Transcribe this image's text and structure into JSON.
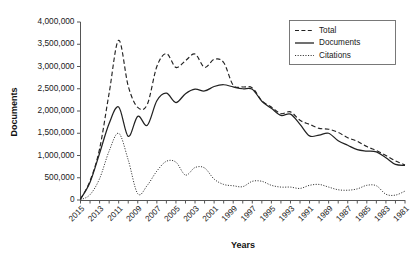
{
  "chart_data": {
    "type": "line",
    "title": "",
    "xlabel": "Years",
    "ylabel": "Documents",
    "grid": false,
    "legend_position": "top-right",
    "x_reversed": true,
    "ylim": [
      0,
      4000000
    ],
    "ytick_labels": [
      "4,000,000",
      "3,500,000",
      "3,000,000",
      "2,500,000",
      "2,000,000",
      "1,500,000",
      "1,000,000",
      "500,000",
      "0"
    ],
    "ytick_values": [
      4000000,
      3500000,
      3000000,
      2500000,
      2000000,
      1500000,
      1000000,
      500000,
      0
    ],
    "x": [
      2015,
      2014,
      2013,
      2012,
      2011,
      2010,
      2009,
      2008,
      2007,
      2006,
      2005,
      2004,
      2003,
      2002,
      2001,
      2000,
      1999,
      1998,
      1997,
      1996,
      1995,
      1994,
      1993,
      1992,
      1991,
      1990,
      1989,
      1988,
      1987,
      1986,
      1985,
      1984,
      1983,
      1982,
      1981
    ],
    "xtick_labels": [
      "2015",
      "",
      "2013",
      "",
      "2011",
      "",
      "2009",
      "",
      "2007",
      "",
      "2005",
      "",
      "2003",
      "",
      "2001",
      "",
      "1999",
      "",
      "1997",
      "",
      "1995",
      "",
      "1993",
      "",
      "1991",
      "",
      "1989",
      "",
      "1987",
      "",
      "1985",
      "",
      "1983",
      "",
      "1981"
    ],
    "series": [
      {
        "name": "Total",
        "style": "dashed",
        "values": [
          20000,
          430000,
          1150000,
          2400000,
          3590000,
          2560000,
          2080000,
          2150000,
          3000000,
          3290000,
          2980000,
          3130000,
          3280000,
          2980000,
          3160000,
          3090000,
          2580000,
          2540000,
          2520000,
          2230000,
          2090000,
          1940000,
          1980000,
          1790000,
          1700000,
          1610000,
          1590000,
          1520000,
          1400000,
          1320000,
          1200000,
          1110000,
          1000000,
          880000,
          790000
        ]
      },
      {
        "name": "Documents",
        "style": "solid",
        "values": [
          20000,
          400000,
          1050000,
          1720000,
          2090000,
          1430000,
          1880000,
          1680000,
          2230000,
          2400000,
          2190000,
          2390000,
          2490000,
          2450000,
          2550000,
          2590000,
          2540000,
          2500000,
          2490000,
          2220000,
          2060000,
          1900000,
          1930000,
          1700000,
          1440000,
          1460000,
          1500000,
          1330000,
          1230000,
          1130000,
          1100000,
          1080000,
          950000,
          800000,
          780000
        ]
      },
      {
        "name": "Citations",
        "style": "dotted",
        "values": [
          5000,
          120000,
          480000,
          1100000,
          1500000,
          900000,
          140000,
          330000,
          650000,
          870000,
          850000,
          560000,
          730000,
          720000,
          470000,
          350000,
          320000,
          300000,
          420000,
          420000,
          330000,
          290000,
          290000,
          260000,
          330000,
          350000,
          290000,
          230000,
          220000,
          250000,
          330000,
          320000,
          130000,
          110000,
          200000
        ]
      }
    ]
  },
  "legend": {
    "entries": [
      {
        "label": "Total",
        "style": "dashed"
      },
      {
        "label": "Documents",
        "style": "solid"
      },
      {
        "label": "Citations",
        "style": "dotted"
      }
    ]
  }
}
